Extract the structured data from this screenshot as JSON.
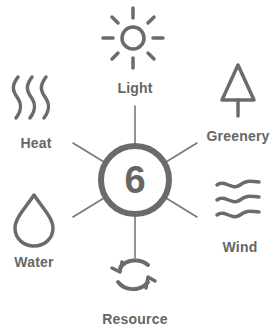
{
  "diagram": {
    "center": {
      "value": "6"
    },
    "items": [
      {
        "label": "Light",
        "icon": "sun-icon"
      },
      {
        "label": "Greenery",
        "icon": "tree-icon"
      },
      {
        "label": "Wind",
        "icon": "wind-icon"
      },
      {
        "label": "Resource",
        "icon": "recycle-icon"
      },
      {
        "label": "Water",
        "icon": "water-drop-icon"
      },
      {
        "label": "Heat",
        "icon": "heat-waves-icon"
      }
    ],
    "colors": {
      "stroke": "#6b6b6b",
      "text": "#666666",
      "background": "#ffffff"
    }
  }
}
